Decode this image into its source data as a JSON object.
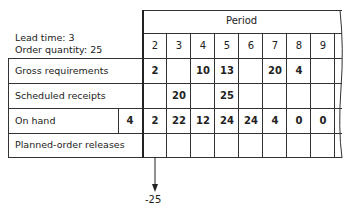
{
  "params": {
    "lead_time": "Lead time: 3",
    "order_quantity": "Order quantity: 25"
  },
  "header": {
    "period_label": "Period",
    "periods": [
      "2",
      "3",
      "4",
      "5",
      "6",
      "7",
      "8",
      "9"
    ]
  },
  "rows": [
    {
      "label": "Gross requirements",
      "initial": "",
      "values": [
        "2",
        "",
        "10",
        "13",
        "",
        "20",
        "4",
        ""
      ]
    },
    {
      "label": "Scheduled receipts",
      "initial": "",
      "values": [
        "",
        "20",
        "",
        "25",
        "",
        "",
        "",
        ""
      ]
    },
    {
      "label": "On hand",
      "initial": "4",
      "values": [
        "2",
        "22",
        "12",
        "24",
        "24",
        "4",
        "0",
        "0"
      ]
    },
    {
      "label": "Planned-order releases",
      "initial": "",
      "values": [
        "",
        "",
        "",
        "",
        "",
        "",
        "",
        ""
      ]
    }
  ],
  "annotation": {
    "arrow_label": "-25"
  }
}
